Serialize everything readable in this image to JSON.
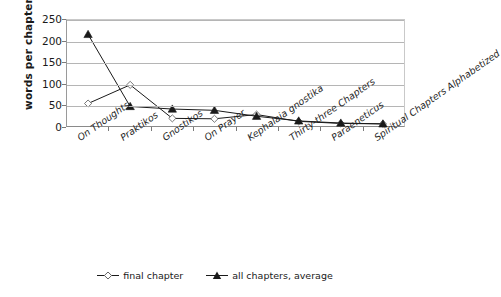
{
  "chart_data": {
    "type": "line",
    "title": "",
    "xlabel": "",
    "ylabel": "words per chapter",
    "ylim": [
      0,
      250
    ],
    "yticks": [
      0,
      50,
      100,
      150,
      200,
      250
    ],
    "grid": true,
    "legend_position": "bottom",
    "categories": [
      "On Thoughts",
      "Praktikos",
      "Gnostikos",
      "On Prayer",
      "Kephalaia gnostika",
      "Thirty-three Chapters",
      "Paraeneticus",
      "Spiritual Chapters Alphabetized"
    ],
    "series": [
      {
        "name": "final chapter",
        "marker": "open-diamond",
        "values": [
          53,
          97,
          18,
          17,
          27,
          11,
          6,
          5
        ]
      },
      {
        "name": "all chapters, average",
        "marker": "filled-triangle",
        "values": [
          216,
          46,
          40,
          37,
          23,
          12,
          7,
          5
        ]
      }
    ]
  },
  "axis": {
    "y_title": "words per chapter",
    "y_tick_labels": [
      "250",
      "200",
      "150",
      "100",
      "50",
      "0"
    ]
  },
  "legend": {
    "items": [
      {
        "label": "final chapter",
        "marker": "open-diamond-marker-icon"
      },
      {
        "label": "all chapters, average",
        "marker": "filled-triangle-marker-icon"
      }
    ]
  },
  "colors": {
    "series_line": "#1a1a1a",
    "gridline": "#b5b5b5",
    "axis": "#8a8a8a",
    "text": "#1a1a1a",
    "background": "#ffffff"
  }
}
